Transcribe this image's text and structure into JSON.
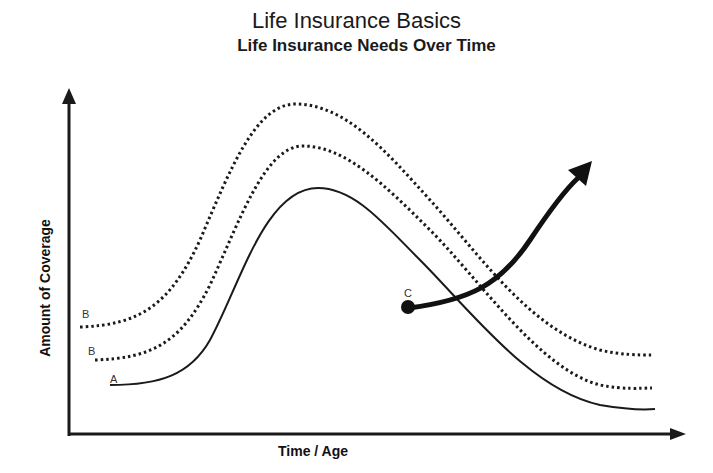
{
  "title": "Life Insurance Basics",
  "subtitle": "Life Insurance Needs Over Time",
  "axes": {
    "x_label": "Time / Age",
    "y_label": "Amount of Coverage"
  },
  "curves": [
    {
      "id": "B-upper",
      "label": "B",
      "style": "dotted"
    },
    {
      "id": "B-lower",
      "label": "B",
      "style": "dotted"
    },
    {
      "id": "A",
      "label": "A",
      "style": "solid"
    }
  ],
  "arrow": {
    "label": "C",
    "style": "thick-arrow"
  },
  "colors": {
    "line": "#1a1a1a",
    "background": "#ffffff"
  }
}
